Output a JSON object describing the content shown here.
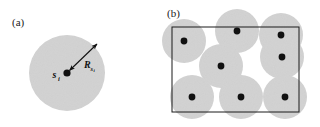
{
  "figure": {
    "width": 320,
    "height": 127,
    "background_color": "#ffffff",
    "disc_fill_color": "#d2d2d2",
    "dot_color": "#111111",
    "rect_stroke_color": "#1a1a1a",
    "arrow_color": "#111111"
  },
  "panel_a": {
    "label": "(a)",
    "label_x": 12,
    "label_y": 26,
    "disc": {
      "cx": 67,
      "cy": 73,
      "r": 38
    },
    "node": {
      "cx": 67,
      "cy": 73,
      "r": 3.6
    },
    "node_label": {
      "base": "s",
      "sub": "i",
      "x": 54,
      "y": 77
    },
    "radius_label": {
      "base": "R",
      "sub": "s",
      "sub2": "i",
      "x": 84,
      "y": 68
    },
    "arrow": {
      "x1": 69.5,
      "y1": 70.5,
      "x2": 97,
      "y2": 44,
      "double_headed": true
    }
  },
  "panel_b": {
    "label": "(b)",
    "label_x": 167,
    "label_y": 17,
    "region_rect": {
      "x": 172,
      "y": 27,
      "width": 127,
      "height": 85
    },
    "disc_radius": 22,
    "node_radius": 3.4,
    "discs": [
      {
        "cx": 184,
        "cy": 41
      },
      {
        "cx": 237,
        "cy": 31
      },
      {
        "cx": 281,
        "cy": 35
      },
      {
        "cx": 282,
        "cy": 57
      },
      {
        "cx": 221,
        "cy": 66
      },
      {
        "cx": 192,
        "cy": 97
      },
      {
        "cx": 241,
        "cy": 97
      },
      {
        "cx": 285,
        "cy": 97
      }
    ],
    "nodes": [
      {
        "cx": 184,
        "cy": 41
      },
      {
        "cx": 237,
        "cy": 31
      },
      {
        "cx": 281,
        "cy": 35
      },
      {
        "cx": 282,
        "cy": 57
      },
      {
        "cx": 221,
        "cy": 66
      },
      {
        "cx": 192,
        "cy": 97
      },
      {
        "cx": 241,
        "cy": 97
      },
      {
        "cx": 285,
        "cy": 97
      }
    ]
  }
}
